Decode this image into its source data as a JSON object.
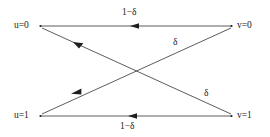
{
  "diagram": {
    "type": "binary-symmetric-channel",
    "background_color": "#ffffff",
    "line_color": "#3a3a3a",
    "text_color": "#1a1a1a",
    "nodes": {
      "input_top": {
        "label": "u=0",
        "var": "u",
        "value": "0",
        "x": 40,
        "y": 26
      },
      "input_bottom": {
        "label": "u=1",
        "var": "u",
        "value": "1",
        "x": 40,
        "y": 116
      },
      "output_top": {
        "label": "v=0",
        "var": "v",
        "value": "0",
        "x": 233,
        "y": 26
      },
      "output_bottom": {
        "label": "v=1",
        "var": "v",
        "value": "1",
        "x": 233,
        "y": 116
      }
    },
    "edges": [
      {
        "id": "top-horizontal",
        "from": "output_top",
        "to": "input_top",
        "label": "1−δ",
        "label_x": 135,
        "label_y": 13
      },
      {
        "id": "bottom-horizontal",
        "from": "output_bottom",
        "to": "input_bottom",
        "label": "1−δ",
        "label_x": 135,
        "label_y": 128
      },
      {
        "id": "cross-upper",
        "from": "output_bottom",
        "to": "input_top",
        "label": "δ",
        "label_x": 176,
        "label_y": 43
      },
      {
        "id": "cross-lower",
        "from": "output_top",
        "to": "input_bottom",
        "label": "δ",
        "label_x": 207,
        "label_y": 94
      }
    ],
    "labels": {
      "input_top": "u=0",
      "input_bottom": "u=1",
      "output_top": "v=0",
      "output_bottom": "v=1",
      "top_transition": "1−δ",
      "bottom_transition": "1−δ",
      "cross_upper_transition": "δ",
      "cross_lower_transition": "δ"
    }
  }
}
